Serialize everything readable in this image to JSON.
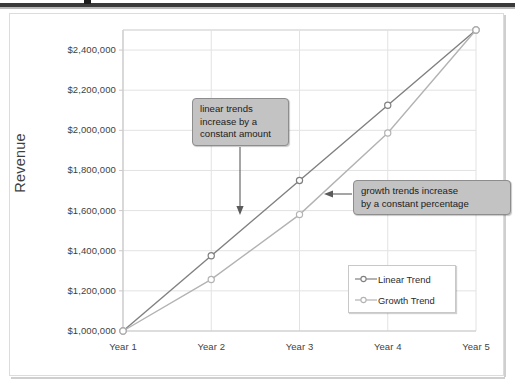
{
  "chart_data": {
    "type": "line",
    "title": "",
    "xlabel": "",
    "ylabel": "Revenue",
    "categories": [
      "Year 1",
      "Year 2",
      "Year 3",
      "Year 4",
      "Year 5"
    ],
    "series": [
      {
        "name": "Linear Trend",
        "values": [
          1000000,
          1375000,
          1750000,
          2125000,
          2500000
        ],
        "color": "#808080",
        "marker": "circle-open"
      },
      {
        "name": "Growth Trend",
        "values": [
          1000000,
          1257000,
          1580000,
          1987000,
          2500000
        ],
        "color": "#b3b3b3",
        "marker": "circle-open"
      }
    ],
    "ylim": [
      1000000,
      2500000
    ],
    "yticks": [
      1000000,
      1200000,
      1400000,
      1600000,
      1800000,
      2000000,
      2200000,
      2400000
    ],
    "ytick_labels": [
      "$1,000,000",
      "$1,200,000",
      "$1,400,000",
      "$1,600,000",
      "$1,800,000",
      "$2,000,000",
      "$2,200,000",
      "$2,400,000"
    ],
    "xtick_labels": [
      "Year 1",
      "Year 2",
      "Year 3",
      "Year 4",
      "Year 5"
    ],
    "grid": "horizontal-and-vertical",
    "legend_position": "inside-right",
    "annotations": [
      {
        "id": "linear-callout",
        "text": "linear trends increase by a constant amount",
        "lines": [
          "linear trends",
          "increase by a",
          "constant amount"
        ],
        "arrow": "down",
        "points_to_series": "Linear Trend"
      },
      {
        "id": "growth-callout",
        "text": "growth trends increase by a constant percentage",
        "lines": [
          "growth trends increase",
          "by a constant percentage"
        ],
        "arrow": "left",
        "points_to_series": "Growth Trend"
      }
    ]
  },
  "colors": {
    "linear_trend": "#808080",
    "growth_trend": "#b3b3b3",
    "grid": "#e2e2e2",
    "axis": "#c9c9c9",
    "callout_fill": "#c3c3c3",
    "callout_border": "#8d8d8d",
    "text": "#3f3f3f"
  },
  "legend": {
    "items": [
      {
        "label": "Linear Trend"
      },
      {
        "label": "Growth Trend"
      }
    ]
  },
  "axis_titles": {
    "y": "Revenue"
  }
}
